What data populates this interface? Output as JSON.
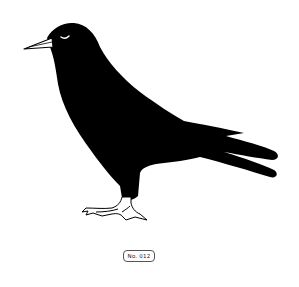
{
  "illustration": {
    "subject": "crow-silhouette",
    "facing": "left",
    "body_color": "#000000",
    "background_color": "#ffffff",
    "beak_color": "#ffffff",
    "feet_color": "#ffffff"
  },
  "label": {
    "text": "No. 012"
  }
}
